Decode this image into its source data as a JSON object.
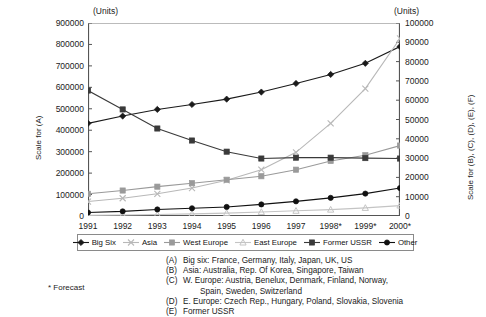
{
  "units_label_left": "(Units)",
  "units_label_right": "(Units)",
  "axis_title_left": "Scale for (A)",
  "axis_title_right": "Scale for (B), (C), (D), (E), (F)",
  "forecast_note": "* Forecast",
  "notes": [
    {
      "key": "(A)",
      "text": "Big six: France, Germany, Italy, Japan, UK, US",
      "cont": null
    },
    {
      "key": "(B)",
      "text": "Asia: Australia, Rep. Of Korea, Singapore, Taiwan",
      "cont": null
    },
    {
      "key": "(C)",
      "text": "W. Europe: Austria, Benelux, Denmark, Finland, Norway,",
      "cont": "Spain, Sweden, Switzerland"
    },
    {
      "key": "(D)",
      "text": "E. Europe: Czech Rep.,  Hungary, Poland, Slovakia, Slovenia",
      "cont": null
    },
    {
      "key": "(E)",
      "text": "Former USSR",
      "cont": null
    }
  ],
  "chart_data": {
    "type": "line",
    "title": "",
    "xlabel": "",
    "ylabel": "Scale for (A)",
    "ylabel_right": "Scale for (B), (C), (D), (E), (F)",
    "grid": false,
    "legend_position": "bottom",
    "categories": [
      "1991",
      "1992",
      "1993",
      "1994",
      "1995",
      "1996",
      "1997",
      "1998*",
      "1999*",
      "2000*"
    ],
    "ylim": [
      0,
      900000
    ],
    "yticks": [
      0,
      100000,
      200000,
      300000,
      400000,
      500000,
      600000,
      700000,
      800000,
      900000
    ],
    "ylim_right": [
      0,
      100000
    ],
    "yticks_right": [
      0,
      10000,
      20000,
      30000,
      40000,
      50000,
      60000,
      70000,
      80000,
      90000,
      100000
    ],
    "series": [
      {
        "name": "Big Six",
        "axis": "left",
        "marker": "diamond",
        "color": "#1a1a1a",
        "values": [
          432000,
          466000,
          497000,
          520000,
          545000,
          578000,
          618000,
          660000,
          712000,
          790000
        ]
      },
      {
        "name": "Asia",
        "axis": "right",
        "marker": "cross",
        "color": "#b8b8b8",
        "values": [
          7500,
          9200,
          11500,
          14500,
          18500,
          24000,
          33000,
          48000,
          66000,
          92000
        ]
      },
      {
        "name": "West Europe",
        "axis": "right",
        "marker": "square",
        "color": "#9a9a9a",
        "values": [
          11500,
          13200,
          15200,
          17000,
          18800,
          20600,
          24000,
          28500,
          31500,
          36500
        ]
      },
      {
        "name": "East Europe",
        "axis": "right",
        "marker": "triangle",
        "color": "#c4c4c4",
        "values": [
          300,
          500,
          800,
          1100,
          1500,
          2100,
          2700,
          3300,
          4200,
          5400
        ]
      },
      {
        "name": "Former USSR",
        "axis": "left",
        "marker": "square",
        "color": "#3a3a3a",
        "values": [
          585000,
          497000,
          408000,
          352000,
          300000,
          268000,
          272000,
          272000,
          270000,
          268000
        ]
      },
      {
        "name": "Other",
        "axis": "right",
        "marker": "circle",
        "color": "#111111",
        "values": [
          1800,
          2400,
          3400,
          4000,
          4700,
          6000,
          7600,
          9400,
          11600,
          14500
        ]
      }
    ]
  }
}
